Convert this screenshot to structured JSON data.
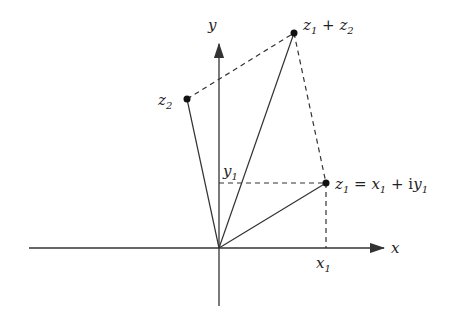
{
  "diagram": {
    "axes": {
      "x_label": "x",
      "y_label": "y"
    },
    "points": [
      {
        "id": "z1",
        "label": "z1 = x1 + iy1",
        "x": 326,
        "y": 183
      },
      {
        "id": "z2",
        "label": "z2",
        "x": 187,
        "y": 99
      },
      {
        "id": "z1_plus_z2",
        "label": "z1 + z2",
        "x": 294,
        "y": 33
      }
    ],
    "origin": {
      "x": 219,
      "y": 248
    },
    "ticks": {
      "x1": "x1",
      "y1": "y1"
    },
    "colors": {
      "line": "#333333",
      "point": "#111111"
    }
  }
}
